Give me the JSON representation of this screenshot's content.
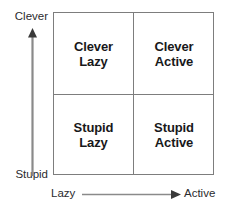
{
  "diagram": {
    "type": "2x2-matrix",
    "title_text": "",
    "axes": {
      "y": {
        "name": "capability-axis",
        "high_label": "Clever",
        "low_label": "Stupid",
        "arrow_direction": "up",
        "arrow_icon": "arrow-up-icon"
      },
      "x": {
        "name": "energy-axis",
        "low_label": "Lazy",
        "high_label": "Active",
        "arrow_direction": "right",
        "arrow_icon": "arrow-right-icon"
      }
    },
    "quadrants": [
      {
        "id": "clever-lazy",
        "position": "top-left",
        "line_1": "Clever",
        "line_2": "Lazy"
      },
      {
        "id": "clever-active",
        "position": "top-right",
        "line_1": "Clever",
        "line_2": "Active"
      },
      {
        "id": "stupid-lazy",
        "position": "bottom-left",
        "line_1": "Stupid",
        "line_2": "Lazy"
      },
      {
        "id": "stupid-active",
        "position": "bottom-right",
        "line_1": "Stupid",
        "line_2": "Active"
      }
    ],
    "colors": {
      "background": "#ffffff",
      "grid_line": "#7d7d7d",
      "quadrant_text": "#18181a",
      "axis_text": "#2b2b2e",
      "arrow": "#8a8a8a"
    }
  }
}
